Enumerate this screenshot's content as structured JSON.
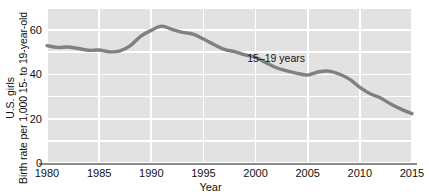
{
  "chart_data": {
    "type": "line",
    "title": "",
    "xlabel": "Year",
    "ylabel_lines": [
      "Birth rate per 1,000 15- to 19-year-old",
      "U.S. girls"
    ],
    "xlim": [
      1980,
      2015
    ],
    "ylim": [
      0,
      70
    ],
    "xticks": [
      1980,
      1985,
      1990,
      1995,
      2000,
      2005,
      2010,
      2015
    ],
    "xticklabels": [
      "1980",
      "1985",
      "1990",
      "1995",
      "2000",
      "2005",
      "2010",
      "2015"
    ],
    "yticks": [
      0,
      20,
      40,
      60
    ],
    "yticklabels": [
      "0",
      "20",
      "40",
      "60"
    ],
    "ygridlines": [
      0,
      10,
      20,
      30,
      40,
      50,
      60,
      70
    ],
    "grid": true,
    "legend_position": "inline-annotation",
    "plot_bg_color": "#e2e2e2",
    "grid_color": "#ffffff",
    "line_color": "#808080",
    "axis_color": "#8c8c8c",
    "series": [
      {
        "name": "15–19 years",
        "annotation": "15–19 years",
        "annotation_x": 1999.2,
        "annotation_y": 47.5,
        "x": [
          1980,
          1981,
          1982,
          1983,
          1984,
          1985,
          1986,
          1987,
          1988,
          1989,
          1990,
          1991,
          1992,
          1993,
          1994,
          1995,
          1996,
          1997,
          1998,
          1999,
          2000,
          2001,
          2002,
          2003,
          2004,
          2005,
          2006,
          2007,
          2008,
          2009,
          2010,
          2011,
          2012,
          2013,
          2014,
          2015
        ],
        "values": [
          53.0,
          52.2,
          52.4,
          51.7,
          50.9,
          51.0,
          50.2,
          50.6,
          53.0,
          57.3,
          59.9,
          61.8,
          60.3,
          59.0,
          58.2,
          56.0,
          53.5,
          51.3,
          50.3,
          48.8,
          47.7,
          45.3,
          43.0,
          41.6,
          40.5,
          39.7,
          41.1,
          41.5,
          40.2,
          37.9,
          34.2,
          31.3,
          29.4,
          26.5,
          24.2,
          22.3
        ]
      }
    ]
  }
}
